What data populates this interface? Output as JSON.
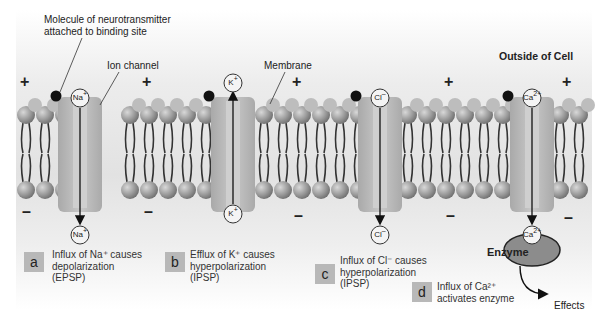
{
  "figure": {
    "title_fragment": "…ology, Synapses…",
    "outside_label": "Outside of Cell",
    "annotations": {
      "neurotransmitter": "Molecule of neurotransmitter\nattached to binding site",
      "ion_channel": "Ion channel",
      "membrane": "Membrane"
    },
    "signs": {
      "positive": "+",
      "negative": "–"
    },
    "ions": {
      "na": {
        "symbol": "Na",
        "charge": "+"
      },
      "k": {
        "symbol": "K",
        "charge": "+"
      },
      "cl": {
        "symbol": "Cl",
        "charge": "–"
      },
      "ca": {
        "symbol": "Ca",
        "charge": "2+"
      }
    },
    "enzyme_label": "Enzyme",
    "effects_label": "Effects",
    "panels": [
      {
        "letter": "a",
        "caption": "Influx of Na⁺ causes\ndepolarization\n(EPSP)"
      },
      {
        "letter": "b",
        "caption": "Efflux of K⁺ causes\nhyperpolarization\n(IPSP)"
      },
      {
        "letter": "c",
        "caption": "Influx of Cl⁻ causes\nhyperpolarization\n(IPSP)"
      },
      {
        "letter": "d",
        "caption": "Influx of Ca²⁺\nactivates enzyme"
      }
    ],
    "colors": {
      "lipid_head": "#9a9a9a",
      "channel": "#b9b9b9",
      "enzyme": "#8c8c8c",
      "badge": "#b8b8b8",
      "neurotransmitter": "#111111"
    }
  }
}
